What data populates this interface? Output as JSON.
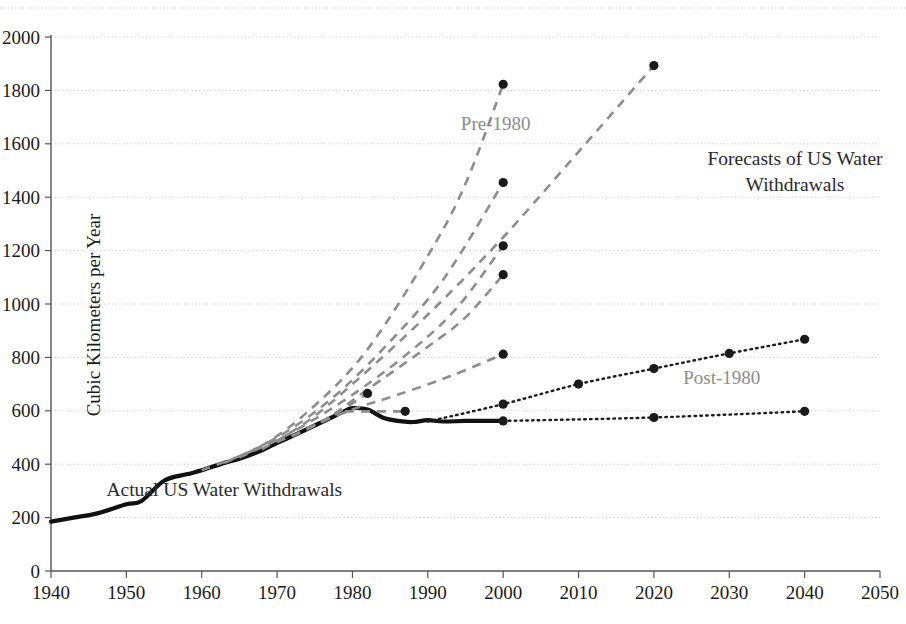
{
  "chart_data": {
    "type": "line",
    "title_line1": "Forecasts of US Water",
    "title_line2": "Withdrawals",
    "xlabel": "",
    "ylabel": "Cubic Kilometers per Year",
    "xlim": [
      1940,
      2050
    ],
    "ylim": [
      0,
      2000
    ],
    "xticks": [
      1940,
      1950,
      1960,
      1970,
      1980,
      1990,
      2000,
      2010,
      2020,
      2030,
      2040,
      2050
    ],
    "yticks": [
      0,
      200,
      400,
      600,
      800,
      1000,
      1200,
      1400,
      1600,
      1800,
      2000
    ],
    "grid": true,
    "grid_axis": "y",
    "legend_position": "inline-annotations",
    "annotations": [
      {
        "name": "actual-label",
        "text": "Actual US Water Withdrawals",
        "x": 1963,
        "y": 280,
        "style": "dark"
      },
      {
        "name": "pre-1980-label",
        "text": "Pre-1980",
        "x": 1999,
        "y": 1650,
        "style": "gray"
      },
      {
        "name": "post-1980-label",
        "text": "Post-1980",
        "x": 2029,
        "y": 700,
        "style": "gray"
      }
    ],
    "series": [
      {
        "name": "Actual US Water Withdrawals",
        "style": "solid",
        "color": "#111111",
        "markers": false,
        "points": [
          [
            1940,
            185
          ],
          [
            1943,
            200
          ],
          [
            1946,
            215
          ],
          [
            1950,
            250
          ],
          [
            1952,
            262
          ],
          [
            1955,
            338
          ],
          [
            1958,
            362
          ],
          [
            1960,
            377
          ],
          [
            1963,
            405
          ],
          [
            1965,
            420
          ],
          [
            1968,
            452
          ],
          [
            1970,
            480
          ],
          [
            1972,
            505
          ],
          [
            1975,
            545
          ],
          [
            1977,
            572
          ],
          [
            1979,
            600
          ],
          [
            1980,
            610
          ],
          [
            1982,
            605
          ],
          [
            1984,
            575
          ],
          [
            1986,
            562
          ],
          [
            1988,
            558
          ],
          [
            1990,
            565
          ],
          [
            1992,
            560
          ],
          [
            1995,
            562
          ],
          [
            1998,
            562
          ],
          [
            2000,
            562
          ]
        ]
      },
      {
        "name": "Pre-1980 forecast A",
        "style": "dashed",
        "color": "#8d8d8d",
        "endpoint": [
          2000,
          1823
        ],
        "points": [
          [
            1960,
            377
          ],
          [
            1968,
            470
          ],
          [
            1975,
            620
          ],
          [
            1982,
            830
          ],
          [
            1990,
            1180
          ],
          [
            1995,
            1450
          ],
          [
            2000,
            1823
          ]
        ]
      },
      {
        "name": "Pre-1980 forecast B",
        "style": "dashed",
        "color": "#8d8d8d",
        "endpoint": [
          2020,
          1893
        ],
        "points": [
          [
            1968,
            455
          ],
          [
            1974,
            560
          ],
          [
            1980,
            700
          ],
          [
            1990,
            960
          ],
          [
            2000,
            1250
          ],
          [
            2010,
            1570
          ],
          [
            2020,
            1893
          ]
        ]
      },
      {
        "name": "Pre-1980 forecast C",
        "style": "dashed",
        "color": "#8d8d8d",
        "endpoint": [
          2000,
          1455
        ],
        "points": [
          [
            1963,
            405
          ],
          [
            1970,
            500
          ],
          [
            1977,
            640
          ],
          [
            1984,
            830
          ],
          [
            1992,
            1090
          ],
          [
            2000,
            1455
          ]
        ]
      },
      {
        "name": "Pre-1980 forecast D",
        "style": "dashed",
        "color": "#8d8d8d",
        "endpoint": [
          2000,
          1218
        ],
        "points": [
          [
            1965,
            425
          ],
          [
            1972,
            520
          ],
          [
            1980,
            660
          ],
          [
            1988,
            830
          ],
          [
            1994,
            990
          ],
          [
            2000,
            1218
          ]
        ]
      },
      {
        "name": "Pre-1980 forecast E",
        "style": "dashed",
        "color": "#8d8d8d",
        "endpoint": [
          2000,
          1110
        ],
        "points": [
          [
            1970,
            483
          ],
          [
            1976,
            560
          ],
          [
            1982,
            680
          ],
          [
            1990,
            840
          ],
          [
            1995,
            950
          ],
          [
            2000,
            1110
          ]
        ]
      },
      {
        "name": "Pre-1980 forecast F",
        "style": "dashed",
        "color": "#8d8d8d",
        "endpoint": [
          2000,
          812
        ],
        "points": [
          [
            1974,
            535
          ],
          [
            1980,
            605
          ],
          [
            1986,
            660
          ],
          [
            1993,
            730
          ],
          [
            2000,
            812
          ]
        ]
      },
      {
        "name": "Pre-1980 forecast G",
        "style": "dashed",
        "color": "#8d8d8d",
        "endpoint": [
          1982,
          665
        ],
        "points": [
          [
            1972,
            505
          ],
          [
            1977,
            575
          ],
          [
            1982,
            665
          ]
        ]
      },
      {
        "name": "Pre-1980 forecast H",
        "style": "dashed",
        "color": "#8d8d8d",
        "endpoint": [
          1987,
          598
        ],
        "points": [
          [
            1979,
            598
          ],
          [
            1983,
            598
          ],
          [
            1987,
            598
          ]
        ]
      },
      {
        "name": "Post-1980 forecast high",
        "style": "dotted",
        "color": "#1d1d1d",
        "markers": true,
        "points": [
          [
            1990,
            560
          ],
          [
            2000,
            625
          ],
          [
            2010,
            700
          ],
          [
            2020,
            758
          ],
          [
            2030,
            815
          ],
          [
            2040,
            868
          ]
        ]
      },
      {
        "name": "Post-1980 forecast low",
        "style": "dotted",
        "color": "#1d1d1d",
        "markers": true,
        "points": [
          [
            2000,
            562
          ],
          [
            2020,
            575
          ],
          [
            2040,
            598
          ]
        ]
      }
    ],
    "marker_points": [
      {
        "x": 2000,
        "y": 1823,
        "series": "Pre-1980 forecast A"
      },
      {
        "x": 2020,
        "y": 1893,
        "series": "Pre-1980 forecast B"
      },
      {
        "x": 2000,
        "y": 1455,
        "series": "Pre-1980 forecast C"
      },
      {
        "x": 2000,
        "y": 1218,
        "series": "Pre-1980 forecast D"
      },
      {
        "x": 2000,
        "y": 1110,
        "series": "Pre-1980 forecast E"
      },
      {
        "x": 2000,
        "y": 812,
        "series": "Pre-1980 forecast F"
      },
      {
        "x": 1982,
        "y": 665,
        "series": "Pre-1980 forecast G"
      },
      {
        "x": 1987,
        "y": 598,
        "series": "Pre-1980 forecast H"
      },
      {
        "x": 2000,
        "y": 625,
        "series": "Post-1980 forecast high"
      },
      {
        "x": 2010,
        "y": 700,
        "series": "Post-1980 forecast high"
      },
      {
        "x": 2020,
        "y": 758,
        "series": "Post-1980 forecast high"
      },
      {
        "x": 2030,
        "y": 815,
        "series": "Post-1980 forecast high"
      },
      {
        "x": 2040,
        "y": 868,
        "series": "Post-1980 forecast high"
      },
      {
        "x": 2000,
        "y": 562,
        "series": "Post-1980 forecast low"
      },
      {
        "x": 2020,
        "y": 575,
        "series": "Post-1980 forecast low"
      },
      {
        "x": 2040,
        "y": 598,
        "series": "Post-1980 forecast low"
      }
    ],
    "colors": {
      "actual": "#111111",
      "pre_1980": "#8d8d8d",
      "post_1980": "#1d1d1d",
      "grid": "#c9c9c9",
      "axis": "#555555",
      "background": "#ffffff"
    }
  }
}
